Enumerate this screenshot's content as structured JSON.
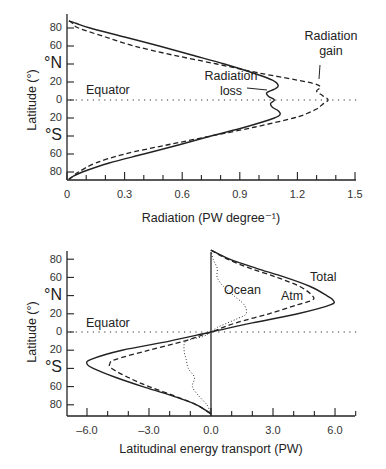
{
  "chart_data": [
    {
      "type": "line",
      "title": "",
      "xlabel": "Radiation (PW degree⁻¹)",
      "ylabel": "Latitude (°)",
      "xlim": [
        0,
        1.5
      ],
      "ylim": [
        -90,
        90
      ],
      "xticks": [
        "0",
        "0.3",
        "0.6",
        "0.9",
        "1.2",
        "1.5"
      ],
      "yticks": [
        "80",
        "60",
        "°N",
        "20",
        "0",
        "20",
        "°S",
        "60",
        "80"
      ],
      "equator_label": "Equator",
      "series": [
        {
          "name": "Radiation loss",
          "style": "solid",
          "latitude": [
            88,
            85,
            80,
            70,
            60,
            50,
            40,
            30,
            22,
            16,
            12,
            8,
            4,
            0,
            -4,
            -8,
            -12,
            -16,
            -20,
            -30,
            -40,
            -50,
            -60,
            -70,
            -80,
            -85,
            -88
          ],
          "values": [
            0.01,
            0.05,
            0.12,
            0.3,
            0.48,
            0.65,
            0.82,
            0.97,
            1.07,
            1.1,
            1.08,
            1.04,
            1.05,
            1.08,
            1.06,
            1.07,
            1.1,
            1.11,
            1.08,
            0.93,
            0.75,
            0.58,
            0.4,
            0.22,
            0.08,
            0.03,
            0.01
          ]
        },
        {
          "name": "Radiation gain",
          "style": "dashed",
          "latitude": [
            88,
            85,
            80,
            70,
            60,
            50,
            40,
            30,
            20,
            15,
            10,
            5,
            0,
            -5,
            -10,
            -15,
            -20,
            -30,
            -40,
            -50,
            -60,
            -70,
            -80,
            -85,
            -88
          ],
          "values": [
            0.01,
            0.03,
            0.06,
            0.2,
            0.35,
            0.55,
            0.78,
            1.0,
            1.25,
            1.32,
            1.3,
            1.33,
            1.36,
            1.33,
            1.3,
            1.25,
            1.18,
            0.98,
            0.75,
            0.52,
            0.3,
            0.15,
            0.06,
            0.03,
            0.01
          ]
        }
      ],
      "annotations": [
        {
          "text": "Radiation gain",
          "lines": [
            "Radiation",
            "gain"
          ]
        },
        {
          "text": "Radiation loss",
          "lines": [
            "Radiation",
            "loss"
          ]
        }
      ]
    },
    {
      "type": "line",
      "title": "",
      "xlabel": "Latitudinal energy transport (PW)",
      "ylabel": "Latitude (°)",
      "xlim": [
        -7,
        7
      ],
      "ylim": [
        -90,
        90
      ],
      "xticks": [
        "–6.0",
        "–3.0",
        "0.0",
        "3.0",
        "6.0"
      ],
      "yticks": [
        "80",
        "60",
        "°N",
        "20",
        "0",
        "20",
        "°S",
        "60",
        "80"
      ],
      "equator_label": "Equator",
      "series": [
        {
          "name": "Total",
          "style": "solid",
          "latitude": [
            90,
            80,
            70,
            60,
            50,
            40,
            35,
            30,
            20,
            10,
            0,
            -10,
            -20,
            -30,
            -35,
            -40,
            -50,
            -60,
            -70,
            -80,
            -90
          ],
          "values": [
            0,
            0.9,
            2.2,
            3.6,
            4.8,
            5.6,
            5.9,
            5.8,
            4.2,
            2.0,
            0,
            -2.0,
            -4.3,
            -5.8,
            -6.0,
            -5.7,
            -4.6,
            -3.3,
            -1.9,
            -0.7,
            0
          ]
        },
        {
          "name": "Atm",
          "style": "dashed",
          "latitude": [
            90,
            80,
            70,
            60,
            50,
            40,
            35,
            30,
            20,
            10,
            0,
            -10,
            -20,
            -30,
            -35,
            -40,
            -50,
            -60,
            -70,
            -80,
            -90
          ],
          "values": [
            0,
            0.8,
            1.9,
            3.2,
            4.3,
            4.9,
            4.9,
            4.2,
            2.8,
            1.2,
            0,
            -1.3,
            -3.0,
            -4.6,
            -4.9,
            -4.8,
            -4.0,
            -3.0,
            -1.8,
            -0.7,
            0
          ]
        },
        {
          "name": "Ocean",
          "style": "dotted",
          "latitude": [
            90,
            80,
            70,
            60,
            50,
            40,
            30,
            20,
            15,
            10,
            5,
            0,
            -5,
            -10,
            -20,
            -30,
            -40,
            -50,
            -60,
            -70,
            -80,
            -90
          ],
          "values": [
            0,
            0.1,
            0.3,
            0.3,
            0.6,
            1.1,
            1.6,
            1.7,
            1.3,
            0.8,
            0.3,
            0,
            -0.4,
            -1.2,
            -1.3,
            -1.2,
            -1.1,
            -0.8,
            -0.9,
            -0.6,
            -0.2,
            0
          ]
        }
      ],
      "annotations": [
        {
          "text": "Total"
        },
        {
          "text": "Atm"
        },
        {
          "text": "Ocean"
        }
      ]
    }
  ],
  "top_chart": {
    "xlabel": "Radiation (PW degree⁻¹)",
    "ylabel": "Latitude (°)",
    "equator": "Equator",
    "gain_line1": "Radiation",
    "gain_line2": "gain",
    "loss_line1": "Radiation",
    "loss_line2": "loss",
    "xticks": [
      "0",
      "0.3",
      "0.6",
      "0.9",
      "1.2",
      "1.5"
    ],
    "ytick_80n": "80",
    "ytick_60n": "60",
    "hemi_n": "°N",
    "ytick_20n": "20",
    "ytick_0": "0",
    "ytick_20s": "20",
    "hemi_s": "°S",
    "ytick_60s": "60",
    "ytick_80s": "80"
  },
  "bottom_chart": {
    "xlabel": "Latitudinal energy transport (PW)",
    "ylabel": "Latitude (°)",
    "equator": "Equator",
    "total": "Total",
    "atm": "Atm",
    "ocean": "Ocean",
    "xticks": [
      "–6.0",
      "–3.0",
      "0.0",
      "3.0",
      "6.0"
    ],
    "ytick_80n": "80",
    "ytick_60n": "60",
    "hemi_n": "°N",
    "ytick_20n": "20",
    "ytick_0": "0",
    "ytick_20s": "20",
    "hemi_s": "°S",
    "ytick_60s": "60",
    "ytick_80s": "80"
  }
}
